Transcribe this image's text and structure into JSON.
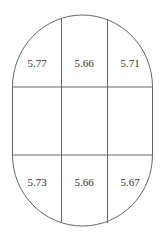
{
  "diagram": {
    "shape": "stadium",
    "stroke_color": "#666666",
    "grid": {
      "rows": 3,
      "cols": 3
    },
    "top_row": [
      {
        "value": "5.77"
      },
      {
        "value": "5.66"
      },
      {
        "value": "5.71"
      }
    ],
    "middle_row": [
      {
        "value": ""
      },
      {
        "value": ""
      },
      {
        "value": ""
      }
    ],
    "bottom_row": [
      {
        "value": "5.73"
      },
      {
        "value": "5.66"
      },
      {
        "value": "5.67"
      }
    ]
  }
}
